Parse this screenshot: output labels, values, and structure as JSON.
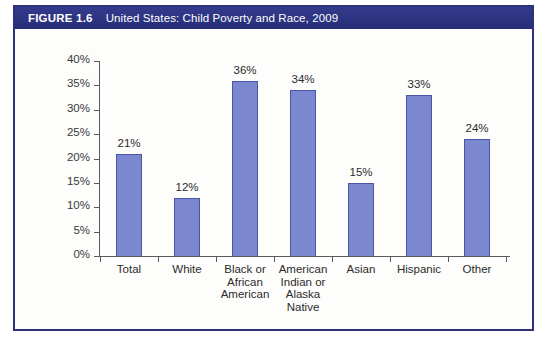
{
  "figure": {
    "number": "FIGURE 1.6",
    "title": "United States: Child Poverty and Race, 2009",
    "header_color": "#2d3483",
    "border_color": "#2e3279",
    "background_color": "#fdfdfb"
  },
  "chart_data": {
    "type": "bar",
    "title": "United States: Child Poverty and Race, 2009",
    "xlabel": "",
    "ylabel": "",
    "ylim": [
      0,
      40
    ],
    "ytick_labels": [
      "0%",
      "5%",
      "10%",
      "15%",
      "20%",
      "25%",
      "30%",
      "35%",
      "40%"
    ],
    "ytick_values": [
      0,
      5,
      10,
      15,
      20,
      25,
      30,
      35,
      40
    ],
    "grid": false,
    "legend": "none",
    "bar_color": "#7b87cf",
    "bar_edge_color": "#4a55a8",
    "categories": [
      "Total",
      "White",
      "Black or African American",
      "American Indian or Alaska Native",
      "Asian",
      "Hispanic",
      "Other"
    ],
    "category_lines": [
      [
        "Total"
      ],
      [
        "White"
      ],
      [
        "Black or",
        "African",
        "American"
      ],
      [
        "American",
        "Indian or",
        "Alaska",
        "Native"
      ],
      [
        "Asian"
      ],
      [
        "Hispanic"
      ],
      [
        "Other"
      ]
    ],
    "values": [
      21,
      12,
      36,
      34,
      15,
      33,
      24
    ],
    "data_labels": [
      "21%",
      "12%",
      "36%",
      "34%",
      "15%",
      "33%",
      "24%"
    ]
  }
}
